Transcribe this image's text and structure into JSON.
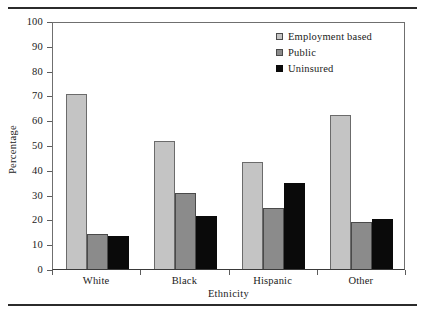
{
  "figure": {
    "top_rule": true,
    "bottom_rule": true
  },
  "chart_data": {
    "type": "bar",
    "title": "",
    "subtitle": "",
    "xlabel": "Ethnicity",
    "ylabel": "Percentage",
    "categories": [
      "White",
      "Black",
      "Hispanic",
      "Other"
    ],
    "series": [
      {
        "name": "Employment based",
        "color": "#c4c4c4",
        "values": [
          70.5,
          51.5,
          43.0,
          62.0
        ]
      },
      {
        "name": "Public",
        "color": "#8b8b8b",
        "values": [
          14.3,
          30.5,
          24.8,
          19.0
        ]
      },
      {
        "name": "Uninsured",
        "color": "#0a0a0a",
        "values": [
          13.3,
          21.5,
          34.8,
          20.0
        ]
      }
    ],
    "ylim": [
      0,
      100
    ],
    "ytick_values": [
      0,
      10,
      20,
      30,
      40,
      50,
      60,
      70,
      80,
      90,
      100
    ],
    "ytick_labels": [
      "0",
      "10",
      "20",
      "30",
      "40",
      "50",
      "60",
      "70",
      "80",
      "90",
      "100"
    ],
    "grid": false,
    "legend_position": "top-right",
    "legend": [
      "Employment based",
      "Public",
      "Uninsured"
    ]
  }
}
